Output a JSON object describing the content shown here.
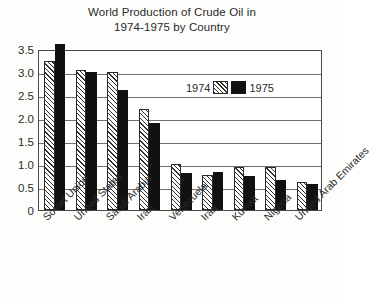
{
  "chart_data": {
    "type": "bar",
    "title": "World Production of Crude Oil in 1974-1975 by Country",
    "title_line1": "World Production of Crude Oil in",
    "title_line2": "1974-1975 by Country",
    "xlabel": "",
    "ylabel": "",
    "ylim": [
      0,
      3.5
    ],
    "grid": true,
    "legend_position": "top-right-inside",
    "categories": [
      "Soviet Union",
      "United States",
      "Saudi Arabia",
      "Iran",
      "Venezuela",
      "Iraq",
      "Kuwait",
      "Nigeria",
      "United Arab Emirates"
    ],
    "ytick_labels": [
      "0",
      "0.5",
      "1.0",
      "1.5",
      "2.0",
      "2.5",
      "3.0",
      "3.5"
    ],
    "ytick_values": [
      0,
      0.5,
      1.0,
      1.5,
      2.0,
      2.5,
      3.0,
      3.5
    ],
    "series": [
      {
        "name": "1974",
        "fill": "hatched",
        "values": [
          3.25,
          3.05,
          3.0,
          2.2,
          1.0,
          0.77,
          0.93,
          0.93,
          0.6
        ]
      },
      {
        "name": "1975",
        "fill": "black",
        "values": [
          3.6,
          3.0,
          2.6,
          1.9,
          0.8,
          0.83,
          0.75,
          0.65,
          0.57
        ]
      }
    ]
  },
  "colors": {
    "series_1974": "#ffffff",
    "series_1975": "#111111",
    "frame": "#4a4a4a",
    "gridline": "#6f6f6f",
    "text": "#2b2b2b",
    "background": "#fdfdfc"
  }
}
